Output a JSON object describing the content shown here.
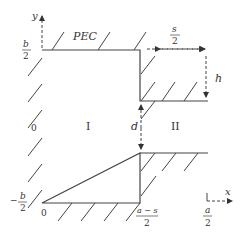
{
  "diagram": {
    "axis_labels": {
      "y": "y",
      "x": "x"
    },
    "boundary_label": "PEC",
    "regions": {
      "region1": "I",
      "region2": "II"
    },
    "dimensions": {
      "s_half_num": "s",
      "s_half_den": "2",
      "h": "h",
      "d": "d"
    },
    "y_ticks": {
      "top_num": "b",
      "top_den": "2",
      "zero": "0",
      "bottom_sign": "−",
      "bottom_num": "b",
      "bottom_den": "2"
    },
    "x_ticks": {
      "zero": "0",
      "mid_num": "a − s",
      "mid_den": "2",
      "end_num": "a",
      "end_den": "2"
    },
    "colors": {
      "line": "#444444",
      "text": "#333333"
    }
  }
}
